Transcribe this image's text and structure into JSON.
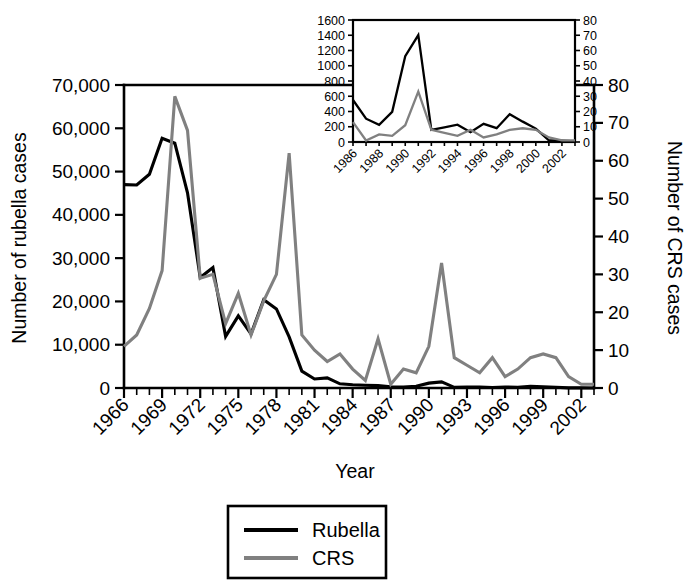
{
  "figure": {
    "background": "#ffffff",
    "rubella_color": "#000000",
    "crs_color": "#808080"
  },
  "main_axis": {
    "xlabel": "Year",
    "ylabel_left": "Number of rubella cases",
    "ylabel_right": "Number of CRS cases",
    "yticks_left": [
      "0",
      "10,000",
      "20,000",
      "30,000",
      "40,000",
      "50,000",
      "60,000",
      "70,000"
    ],
    "yticks_right": [
      "0",
      "10",
      "20",
      "30",
      "40",
      "50",
      "60",
      "70",
      "80"
    ],
    "xticks": [
      "1966",
      "1969",
      "1972",
      "1975",
      "1978",
      "1981",
      "1984",
      "1987",
      "1990",
      "1993",
      "1996",
      "1999",
      "2002"
    ]
  },
  "inset_axis": {
    "yticks_left": [
      "0",
      "200",
      "400",
      "600",
      "800",
      "1000",
      "1200",
      "1400",
      "1600"
    ],
    "yticks_right": [
      "0",
      "10",
      "20",
      "30",
      "40",
      "50",
      "60",
      "70",
      "80"
    ],
    "xticks": [
      "1986",
      "1988",
      "1990",
      "1992",
      "1994",
      "1996",
      "1998",
      "2000",
      "2002"
    ]
  },
  "legend": {
    "items": [
      {
        "label": "Rubella",
        "color": "#000000",
        "name": "legend-item-rubella"
      },
      {
        "label": "CRS",
        "color": "#808080",
        "name": "legend-item-crs"
      }
    ]
  },
  "chart_data": {
    "type": "line",
    "title": "",
    "xlabel": "Year",
    "ylabel": "Number of rubella cases",
    "ylabel_secondary": "Number of CRS cases",
    "grid": false,
    "legend_position": "bottom-center",
    "xlim": [
      1966,
      2003
    ],
    "ylim_left": [
      0,
      70000
    ],
    "ylim_right": [
      0,
      80
    ],
    "x": [
      1966,
      1967,
      1968,
      1969,
      1970,
      1971,
      1972,
      1973,
      1974,
      1975,
      1976,
      1977,
      1978,
      1979,
      1980,
      1981,
      1982,
      1983,
      1984,
      1985,
      1986,
      1987,
      1988,
      1989,
      1990,
      1991,
      1992,
      1993,
      1994,
      1995,
      1996,
      1997,
      1998,
      1999,
      2000,
      2001,
      2002,
      2003
    ],
    "series": [
      {
        "name": "Rubella",
        "axis": "left",
        "color": "#000000",
        "units": "cases",
        "values": [
          46975,
          46888,
          49371,
          57686,
          56552,
          45086,
          25507,
          27804,
          11917,
          16652,
          12491,
          20395,
          18269,
          11795,
          3904,
          2077,
          2325,
          970,
          752,
          630,
          551,
          306,
          225,
          396,
          1125,
          1401,
          160,
          192,
          227,
          128,
          238,
          181,
          364,
          267,
          176,
          23,
          18,
          7
        ]
      },
      {
        "name": "CRS",
        "axis": "right",
        "color": "#808080",
        "units": "cases",
        "values": [
          11,
          14,
          21,
          31,
          77,
          68,
          29,
          30,
          17,
          25,
          14,
          23,
          30,
          62,
          14,
          10,
          7,
          9,
          5,
          2,
          13,
          1,
          5,
          4,
          11,
          33,
          8,
          6,
          4,
          8,
          3,
          5,
          8,
          9,
          8,
          3,
          1,
          1
        ]
      }
    ],
    "inset": {
      "type": "line",
      "xlim": [
        1986,
        2003
      ],
      "ylim_left": [
        0,
        1600
      ],
      "ylim_right": [
        0,
        80
      ],
      "x": [
        1986,
        1987,
        1988,
        1989,
        1990,
        1991,
        1992,
        1993,
        1994,
        1995,
        1996,
        1997,
        1998,
        1999,
        2000,
        2001,
        2002,
        2003
      ],
      "series": [
        {
          "name": "Rubella",
          "axis": "left",
          "color": "#000000",
          "values": [
            551,
            306,
            225,
            396,
            1125,
            1401,
            160,
            192,
            227,
            128,
            238,
            181,
            364,
            267,
            176,
            23,
            18,
            7
          ]
        },
        {
          "name": "CRS",
          "axis": "right",
          "color": "#808080",
          "values": [
            13,
            1,
            5,
            4,
            11,
            33,
            8,
            6,
            4,
            8,
            3,
            5,
            8,
            9,
            8,
            3,
            1,
            1
          ]
        }
      ]
    }
  }
}
